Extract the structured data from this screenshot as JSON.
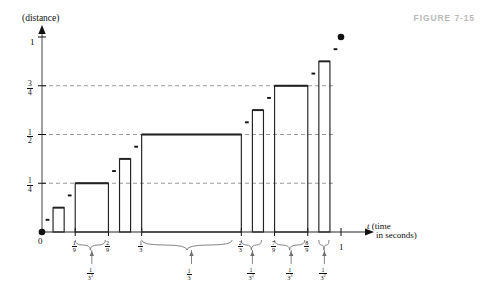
{
  "figure": {
    "label": "FIGURE 7-15",
    "caption_color": "#b9b9b9"
  },
  "axes": {
    "y_axis_title": "(distance)",
    "x_axis_title_line1": "t (time",
    "x_axis_title_line2": "in seconds)",
    "x_axis_var": "t",
    "x_axis_paren1": "(time",
    "x_axis_paren2": "in seconds)",
    "origin_label": "0",
    "y_ticks": [
      {
        "value": 1.0,
        "num": "1",
        "den": "",
        "display": "1"
      },
      {
        "value": 0.75,
        "num": "3",
        "den": "4",
        "display": "3/4"
      },
      {
        "value": 0.5,
        "num": "1",
        "den": "2",
        "display": "1/2"
      },
      {
        "value": 0.25,
        "num": "1",
        "den": "4",
        "display": "1/4"
      }
    ],
    "x_ticks": [
      {
        "value": 0.1111,
        "num": "1",
        "den": "9",
        "display": "1/9"
      },
      {
        "value": 0.2222,
        "num": "2",
        "den": "9",
        "display": "2/9"
      },
      {
        "value": 0.3333,
        "num": "1",
        "den": "3",
        "display": "1/3"
      },
      {
        "value": 0.6667,
        "num": "2",
        "den": "3",
        "display": "2/3"
      },
      {
        "value": 0.7778,
        "num": "7",
        "den": "9",
        "display": "7/9"
      },
      {
        "value": 0.8889,
        "num": "8",
        "den": "9",
        "display": "8/9"
      },
      {
        "value": 1.0,
        "num": "1",
        "den": "",
        "display": "1"
      }
    ],
    "gridlines": [
      0.25,
      0.5,
      0.75
    ],
    "grid_color": "#8f8f8f",
    "axis_color": "#6f6f6f",
    "curve_color": "#222222"
  },
  "braces": [
    {
      "id": "brace-1-9-2-9",
      "x0": 0.1111,
      "x1": 0.2222,
      "num": "1",
      "den": "3",
      "exp": "2",
      "label": "1/3^2"
    },
    {
      "id": "brace-1-3-2-3",
      "x0": 0.3333,
      "x1": 0.6667,
      "num": "1",
      "den": "3",
      "exp": "",
      "label": "1/3"
    },
    {
      "id": "brace-7-9-8-9-a",
      "x0": 0.6667,
      "x1": 0.7407,
      "num": "1",
      "den": "3",
      "exp": "3",
      "label": "1/3^3"
    },
    {
      "id": "brace-7-9-8-9-b",
      "x0": 0.7778,
      "x1": 0.8889,
      "num": "1",
      "den": "3",
      "exp": "2",
      "label": "1/3^2"
    },
    {
      "id": "brace-8-9-1",
      "x0": 0.9259,
      "x1": 0.963,
      "num": "1",
      "den": "3",
      "exp": "2",
      "label": "1/3^2"
    }
  ],
  "chart_data": {
    "type": "line",
    "xlabel": "t (time in seconds)",
    "ylabel": "(distance)",
    "xlim": [
      0,
      1
    ],
    "ylim": [
      0,
      1
    ],
    "grid": "horizontal-dashed-at-1/4-1/2-3/4",
    "plateaus": [
      {
        "x0": 0.1111,
        "x1": 0.2222,
        "y": 0.25,
        "ylabel": "1/4"
      },
      {
        "x0": 0.3333,
        "x1": 0.6667,
        "y": 0.5,
        "ylabel": "1/2"
      },
      {
        "x0": 0.7778,
        "x1": 0.8889,
        "y": 0.75,
        "ylabel": "3/4"
      },
      {
        "x0": 0.037,
        "x1": 0.0741,
        "y": 0.125,
        "ylabel": "1/8"
      },
      {
        "x0": 0.2593,
        "x1": 0.2963,
        "y": 0.375,
        "ylabel": "3/8"
      },
      {
        "x0": 0.7037,
        "x1": 0.7407,
        "y": 0.625,
        "ylabel": "5/8"
      },
      {
        "x0": 0.9259,
        "x1": 0.963,
        "y": 0.875,
        "ylabel": "7/8"
      }
    ],
    "endpoints": [
      {
        "x": 0.0,
        "y": 0.0,
        "marker": "filled-dot"
      },
      {
        "x": 1.0,
        "y": 1.0,
        "marker": "filled-dot"
      }
    ],
    "dash_steps": [
      {
        "x0": 0.0123,
        "x1": 0.0247,
        "y": 0.0625
      },
      {
        "x0": 0.0864,
        "x1": 0.0988,
        "y": 0.1875
      },
      {
        "x0": 0.2346,
        "x1": 0.2469,
        "y": 0.3125
      },
      {
        "x0": 0.3086,
        "x1": 0.321,
        "y": 0.4375
      },
      {
        "x0": 0.679,
        "x1": 0.6914,
        "y": 0.5625
      },
      {
        "x0": 0.7531,
        "x1": 0.7654,
        "y": 0.6875
      },
      {
        "x0": 0.9012,
        "x1": 0.9136,
        "y": 0.8125
      },
      {
        "x0": 0.9753,
        "x1": 0.9877,
        "y": 0.9375
      }
    ]
  }
}
